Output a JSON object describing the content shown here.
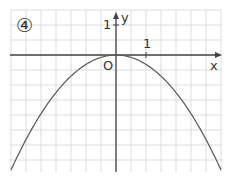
{
  "panel_label": "④",
  "chart_data": {
    "type": "line",
    "title": "",
    "xlabel": "x",
    "ylabel": "y",
    "origin_label": "O",
    "x_tick_label": "1",
    "y_tick_label": "1",
    "function": "y = -1/3 x^2 (approx)",
    "vertex": [
      0,
      0
    ],
    "xlim": [
      -3.5,
      3.5
    ],
    "ylim": [
      -3.9,
      1.5
    ],
    "grid": true,
    "grid_step": 0.5,
    "x": [
      -3.5,
      -3,
      -2,
      -1,
      0,
      1,
      2,
      3,
      3.5
    ],
    "values": [
      -3.83,
      -2.81,
      -1.25,
      -0.31,
      0,
      -0.31,
      -1.25,
      -2.81,
      -3.83
    ]
  },
  "colors": {
    "grid": "#dddddd",
    "axis": "#444444",
    "curve": "#555555"
  }
}
